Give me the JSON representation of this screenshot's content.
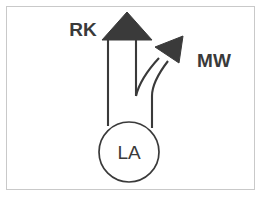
{
  "figure": {
    "background_color": "#ffffff",
    "border_color": "#c9c9c9",
    "stroke_color": "#3a3a3a",
    "fill_color": "#3a3a3a",
    "labels": {
      "rk": "RK",
      "mw": "MW",
      "la": "LA"
    },
    "nodes": [
      {
        "id": "la",
        "label": "LA",
        "shape": "circle",
        "cx": 129,
        "cy": 152,
        "r": 30
      }
    ],
    "arrows": [
      {
        "id": "rk",
        "label": "RK",
        "direction": "up",
        "head": "filled-triangle",
        "from": "la",
        "to": "rk"
      },
      {
        "id": "mw",
        "label": "MW",
        "direction": "up-right",
        "head": "filled-triangle",
        "from": "la",
        "to": "mw"
      }
    ]
  }
}
